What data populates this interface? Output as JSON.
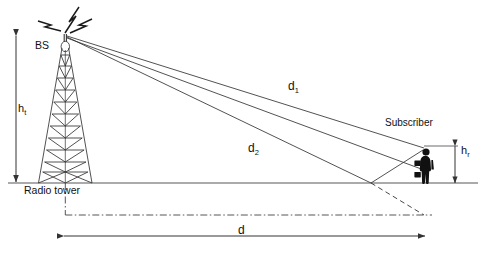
{
  "diagram": {
    "labels": {
      "bs": "BS",
      "radio_tower": "Radio tower",
      "subscriber": "Subscriber",
      "tower_height": "h",
      "tower_height_sub": "t",
      "receiver_height": "h",
      "receiver_height_sub": "r",
      "direct_path": "d",
      "direct_path_sub": "1",
      "reflected_path": "d",
      "reflected_path_sub": "2",
      "separation": "d"
    },
    "colors": {
      "ink": "#1a1a1a",
      "line": "#444444",
      "figure": "#111111",
      "background": "#ffffff"
    },
    "icons": {
      "antenna": "radiation-waves-icon",
      "tower": "lattice-tower-icon",
      "person": "subscriber-person-icon"
    }
  }
}
